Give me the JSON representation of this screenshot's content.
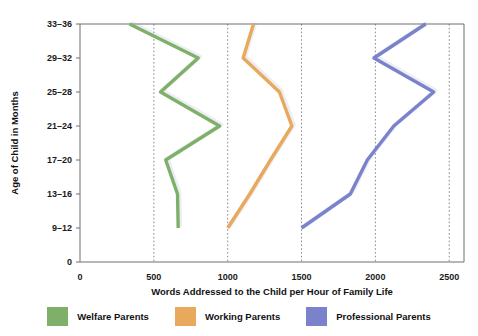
{
  "chart_data": {
    "type": "line",
    "title": "",
    "xlabel": "Words Addressed to the Child per Hour of Family Life",
    "ylabel": "Age of Child in Months",
    "orientation": "horizontal-value-axis",
    "categories": [
      "9–12",
      "13–16",
      "17–20",
      "21–24",
      "25–28",
      "29–32",
      "33–36"
    ],
    "y_tick_labels": [
      "0",
      "9–12",
      "13–16",
      "17–20",
      "21–24",
      "25–28",
      "29–32",
      "33–36"
    ],
    "x_tick_labels": [
      "0",
      "500",
      "1000",
      "1500",
      "2000",
      "2500"
    ],
    "x_ticks": [
      0,
      500,
      1000,
      1500,
      2000,
      2500
    ],
    "xlim": [
      0,
      2600
    ],
    "grid": "vertical-dotted",
    "legend_position": "bottom-center",
    "series": [
      {
        "name": "Welfare Parents",
        "color": "#7fb069",
        "values": [
          665,
          660,
          580,
          945,
          545,
          800,
          335
        ]
      },
      {
        "name": "Working Parents",
        "color": "#e8a95c",
        "values": [
          1000,
          1150,
          1290,
          1435,
          1350,
          1105,
          1175
        ]
      },
      {
        "name": "Professional Parents",
        "color": "#7b82cc",
        "values": [
          1500,
          1830,
          1945,
          2125,
          2395,
          1990,
          2340
        ]
      }
    ]
  },
  "legend": {
    "items": [
      {
        "label": "Welfare Parents",
        "color": "#7fb069"
      },
      {
        "label": "Working Parents",
        "color": "#e8a95c"
      },
      {
        "label": "Professional Parents",
        "color": "#7b82cc"
      }
    ]
  },
  "axes": {
    "x_title": "Words Addressed to the Child per Hour of Family Life",
    "y_title": "Age of Child in Months"
  }
}
